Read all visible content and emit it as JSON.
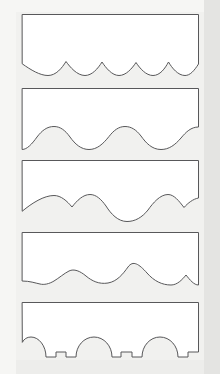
{
  "document": {
    "title": "Scalloped Edge Profile Sheet",
    "description": "Five rectangular panels, each with a different decorative scalloped or wavy bottom edge profile",
    "medium": "scanned line drawing",
    "panel_count": 5
  },
  "canvas": {
    "width": 220,
    "height": 374,
    "background_color": "#f1f1ef",
    "panel_fill": "#ffffff",
    "line_color": "#58585a",
    "line_width": 1
  },
  "panels": [
    {
      "index": 1,
      "name": "panel-small-scallop",
      "edge_style": "small cusped scallops",
      "x": 22,
      "y": 14,
      "width": 177,
      "height": 62,
      "cusp_count": 5,
      "description": "shallow arcs with sharp upward cusps, alternating narrow and wide spans",
      "path": "M22.5,14.5 L198.5,14.5 L198.5,64 C194,71 190,75.5 185,75.5 C178,75.5 172,68 168.5,62 C165,68.5 160,75.5 153,75.5 C146,75.5 140,68.5 136,62.5 C132,68.5 126,75.5 119,75.5 C112,75.5 106,68 102,62 C98,68.5 92,75.5 85,75.5 C77,75.5 70,67 66,61.5 C62,68 56,75.5 48,75.5 C40,75.5 31,70 22.5,64 Z"
    },
    {
      "index": 2,
      "name": "panel-sine-wave",
      "edge_style": "smooth sine wave",
      "x": 22,
      "y": 88,
      "width": 177,
      "height": 62,
      "wave_count": 3,
      "description": "continuous rounded undulating wave with three crests and three troughs, no sharp cusps",
      "path": "M22.5,88.5 L198.5,88.5 L198.5,127 C191,127 186,132 181,138 C175,145 169,149.5 161,149.5 C152,149.5 146,143 141,136 C136,129.5 131,126.5 125,126.5 C119,126.5 114,130 109,136.5 C103,144 97,149.5 89,149.5 C81,149.5 75,144 70,137 C65,130 60,126.5 54,126.5 C47,126.5 42,130.5 37,137 C32,144 27,149.5 22.5,149.5 Z"
    },
    {
      "index": 3,
      "name": "panel-deep-scallop",
      "edge_style": "deep cusped scallops",
      "x": 22,
      "y": 160,
      "width": 177,
      "height": 62,
      "cusp_count": 5,
      "description": "paired narrow arcs alternating with broad deep arcs terminating in sharp cusps",
      "path": "M22.5,160.5 L198.5,160.5 L198.5,198 C193,199 188,203 184,207.5 C179,201 174,194.5 168,194.5 C160,194.5 153,203 148,210 C142,217.5 135,221.5 127,221.5 C118,221.5 111,214 106,206 C101,199 96,194.5 90,194.5 C83,194.5 77,200.5 72,207 C67,201 61,195.5 54,195.5 C44,195.5 32,203 22.5,211 Z"
    },
    {
      "index": 4,
      "name": "panel-mixed-hump",
      "edge_style": "large humps with small end bumps",
      "x": 22,
      "y": 232,
      "width": 177,
      "height": 62,
      "hump_count": 2,
      "bump_count": 2,
      "description": "small bump near each end, two broad tall rounded humps in the centre meeting at a cusp",
      "path": "M22.5,232.5 L198.5,232.5 L198.5,285 C194,285 190,280 186,275 C182,280 177,285 171,285 C162,285 154,281 147,273 C139,264 133,260 128,267 C123,274 117,281.5 108,283 C99,284.5 92,281 86,276 C80,271 74,268.5 69,271 C64,273.5 59,278 54,281 C49,284 44,285 40,284 C35,283 30,281 22.5,281 Z"
    },
    {
      "index": 5,
      "name": "panel-stepped-arch",
      "edge_style": "stepped arches with flat shoulders",
      "x": 22,
      "y": 302,
      "width": 177,
      "height": 62,
      "arch_count": 3,
      "description": "three rounded arches separated by deep U-shaped valleys, each arch flanked by short flat horizontal steps",
      "path": "M22.5,302.5 L198.5,302.5 L198.5,352 L188,352 L188,357 L178,357 C178,346 170,337 160,337 C150,337 142,346 142,357 L132,357 L132,352 L121,352 L121,357 L112,357 C112,346 104,337 94,337 C84,337 76,346 76,357 L66,357 L66,352 L56,352 L56,357 L46,357 C46,346 39,337 31,337 C27,337 24,339 22.5,342 Z"
    }
  ],
  "edge_profile_names": [
    "small cusped scallops",
    "smooth sine wave",
    "deep cusped scallops",
    "large humps with small end bumps",
    "stepped arches with flat shoulders"
  ]
}
